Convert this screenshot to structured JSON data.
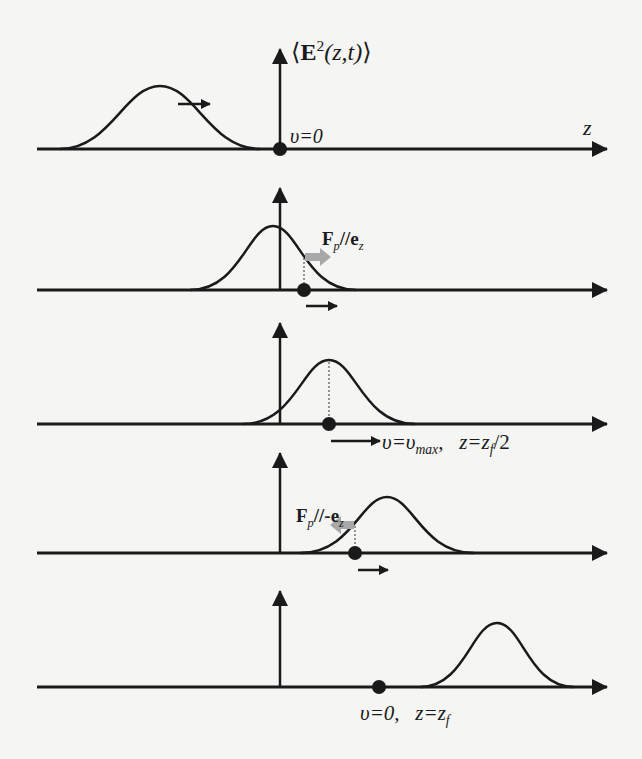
{
  "figure": {
    "y_axis_label": {
      "open": "⟨",
      "E": "E",
      "sup": "2",
      "args": "(z,t)",
      "close": "⟩"
    },
    "x_axis_label": "z",
    "panels": [
      {
        "id": 1,
        "axis_y": 149,
        "axis_top": 48,
        "peak_x": 160,
        "peak_y": 86,
        "particle_x": 280,
        "particle_label": "υ=0",
        "pulse_arrow": "right"
      },
      {
        "id": 2,
        "axis_y": 290,
        "axis_top": 187,
        "peak_x": 273,
        "peak_y": 226,
        "particle_x": 304,
        "force_label": {
          "F": "F",
          "sub": "p",
          "rest": "//",
          "e": "e",
          "esub": "z"
        },
        "force_direction": "+z",
        "velocity_arrow": "right"
      },
      {
        "id": 3,
        "axis_y": 424,
        "axis_top": 322,
        "peak_x": 329,
        "peak_y": 360,
        "particle_x": 329,
        "state_label": {
          "v": "υ=υ",
          "vsub": "max",
          "sep": ",",
          "z": "z=z",
          "zsub": "f",
          "zrest": "/2"
        }
      },
      {
        "id": 4,
        "axis_y": 553,
        "axis_top": 452,
        "peak_x": 387,
        "peak_y": 497,
        "particle_x": 355,
        "force_label": {
          "F": "F",
          "sub": "p",
          "rest": "//-",
          "e": "e",
          "esub": "z"
        },
        "force_direction": "-z",
        "velocity_arrow": "right"
      },
      {
        "id": 5,
        "axis_y": 687,
        "axis_top": 590,
        "peak_x": 497,
        "peak_y": 623,
        "particle_x": 379,
        "state_label": {
          "v": "υ=0,",
          "z": "z=z",
          "zsub": "f"
        }
      }
    ],
    "colors": {
      "ink": "#1a1a1a",
      "force_arrow": "#a8a8a8",
      "background": "#f5f5f3"
    }
  }
}
